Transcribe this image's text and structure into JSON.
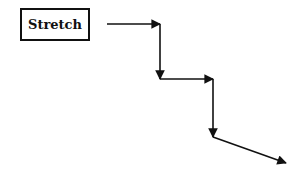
{
  "diagram": {
    "label": "Stretch",
    "colors": {
      "stroke": "#111111",
      "background": "#ffffff"
    },
    "path_points": [
      [
        107,
        24
      ],
      [
        160,
        24
      ],
      [
        160,
        79
      ],
      [
        213,
        79
      ],
      [
        213,
        137
      ],
      [
        286,
        163
      ]
    ]
  }
}
